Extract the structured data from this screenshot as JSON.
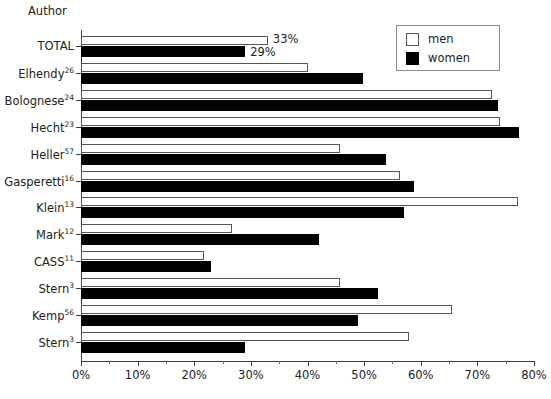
{
  "chart_data": {
    "type": "bar",
    "orientation": "horizontal",
    "title": "",
    "xlabel": "",
    "ylabel": "Author",
    "xlim": [
      0,
      80
    ],
    "xticks": [
      0,
      10,
      20,
      30,
      40,
      50,
      60,
      70,
      80
    ],
    "xtick_labels": [
      "0%",
      "10%",
      "20%",
      "30%",
      "40%",
      "50%",
      "60%",
      "70%",
      "80%"
    ],
    "grid": false,
    "legend_position": "top-right",
    "categories": [
      "TOTAL",
      "Elhendy",
      "Bolognese",
      "Hecht",
      "Heller",
      "Gasperetti",
      "Klein",
      "Mark",
      "CASS",
      "Stern",
      "Kemp",
      "Stern"
    ],
    "category_superscripts": [
      "",
      "26",
      "24",
      "23",
      "57",
      "16",
      "13",
      "12",
      "11",
      "3",
      "56",
      "3"
    ],
    "series": [
      {
        "name": "men",
        "color": "#ffffff",
        "edge_color": "#585858",
        "values": [
          33,
          40,
          72.5,
          74,
          45.8,
          56.4,
          77.2,
          26.7,
          21.8,
          45.8,
          65.5,
          58
        ]
      },
      {
        "name": "women",
        "color": "#000000",
        "edge_color": "#000000",
        "values": [
          29,
          49.8,
          73.7,
          77.4,
          53.9,
          58.8,
          57,
          42,
          23,
          52.5,
          48.9,
          29
        ]
      }
    ],
    "data_labels": [
      {
        "series": "men",
        "category": "TOTAL",
        "text": "33%"
      },
      {
        "series": "women",
        "category": "TOTAL",
        "text": "29%"
      }
    ]
  },
  "axis": {
    "y_axis_title": "Author"
  },
  "legend": {
    "entries": [
      {
        "label": "men",
        "swatch": "open-square"
      },
      {
        "label": "women",
        "swatch": "filled-square"
      }
    ]
  }
}
